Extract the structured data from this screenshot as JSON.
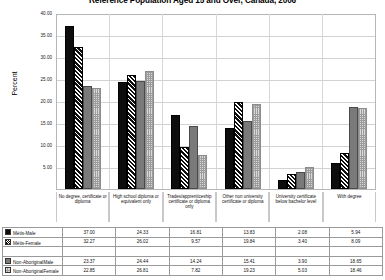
{
  "chart_data": {
    "type": "bar",
    "title": "Reference Population Aged 15 and Over, Canada, 2006",
    "xlabel": "",
    "ylabel": "Percent",
    "ylim": [
      0,
      40
    ],
    "ytick_values": [
      40.0,
      35.0,
      30.0,
      25.0,
      20.0,
      15.0,
      10.0,
      5.0
    ],
    "ytick_labels": [
      "40.00",
      "35.00",
      "30.00",
      "25.00",
      "20.00",
      "15.00",
      "10.00",
      "5.00"
    ],
    "grid": true,
    "legend_position": "bottom-table",
    "categories": [
      "No degree, certificate or diploma",
      "High school diploma or equivalent only",
      "Trades/apprenticeship certificate or diploma only",
      "Other non university certificate or diploma",
      "University certificate below bachelor level",
      "With degree"
    ],
    "series": [
      {
        "name": "Métis-Male",
        "pattern": "solid-black",
        "values": [
          37.0,
          24.33,
          16.81,
          13.83,
          2.08,
          5.94
        ]
      },
      {
        "name": "Métis-Female",
        "pattern": "black-diagonal",
        "values": [
          32.27,
          26.02,
          9.57,
          19.84,
          3.4,
          8.09
        ]
      },
      {
        "name": "Non-AboriginalMale",
        "pattern": "solid-gray",
        "values": [
          23.37,
          24.44,
          14.24,
          15.41,
          3.9,
          18.65
        ]
      },
      {
        "name": "Non-AboriginalFemale",
        "pattern": "light-checker",
        "values": [
          22.85,
          26.81,
          7.82,
          19.23,
          5.03,
          18.46
        ]
      }
    ]
  },
  "colors": {
    "series_0": "#0d0d0d",
    "series_1": "#0f0f0f",
    "series_2": "#7a7a7a",
    "series_3": "#d9d9d9",
    "grid": "#d2d2d2",
    "axis": "#b6b6b6",
    "background": "#ffffff"
  }
}
